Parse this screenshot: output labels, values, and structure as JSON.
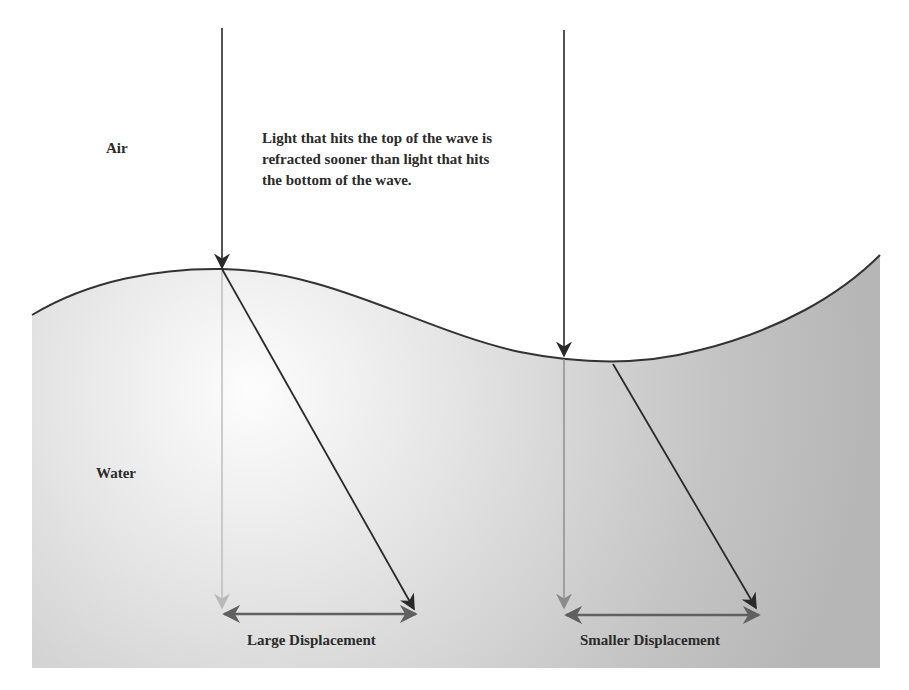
{
  "diagram": {
    "media": {
      "top_label": "Air",
      "bottom_label": "Water"
    },
    "annotation": {
      "lines": [
        "Light that hits the top of the wave is",
        "refracted sooner than light that hits",
        "the bottom of the wave."
      ]
    },
    "displacements": [
      {
        "label": "Large Displacement",
        "location": "wave crest"
      },
      {
        "label": "Smaller Displacement",
        "location": "wave trough"
      }
    ],
    "rays": [
      {
        "name": "incident-ray-crest",
        "kind": "incident",
        "from": [
          222,
          28
        ],
        "to": [
          222,
          268
        ]
      },
      {
        "name": "refracted-ray-crest",
        "kind": "refracted",
        "from": [
          222,
          269
        ],
        "to": [
          414,
          610
        ]
      },
      {
        "name": "reference-ray-crest",
        "kind": "unrefracted-reference",
        "from": [
          222,
          270
        ],
        "to": [
          222,
          608
        ]
      },
      {
        "name": "incident-ray-trough",
        "kind": "incident",
        "from": [
          564,
          30
        ],
        "to": [
          564,
          356
        ]
      },
      {
        "name": "refracted-ray-trough",
        "kind": "refracted",
        "from": [
          613,
          363
        ],
        "to": [
          756,
          609
        ]
      },
      {
        "name": "reference-ray-trough",
        "kind": "unrefracted-reference",
        "from": [
          564,
          358
        ],
        "to": [
          564,
          608
        ]
      }
    ],
    "colors": {
      "background": "#ffffff",
      "water_light": "#fbfbfb",
      "water_dark": "#b8b8b8",
      "surface_line": "#333333",
      "ray_dark": "#2a2a2a",
      "reference_ray_light": "#b9b9b9",
      "reference_ray_mid": "#8a8a8a",
      "displacement_arrow": "#606060",
      "text": "#2b2b2b"
    }
  }
}
